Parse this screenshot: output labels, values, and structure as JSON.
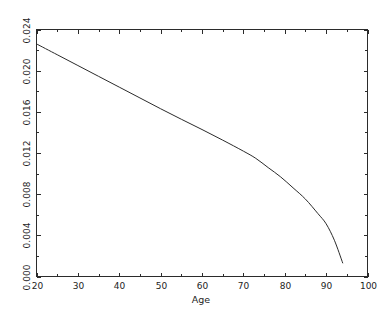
{
  "chart_data": {
    "type": "line",
    "title": "",
    "subtitle": "",
    "xlabel": "Age",
    "ylabel": "",
    "xlim": [
      20,
      100
    ],
    "ylim": [
      0.0,
      0.024
    ],
    "grid": false,
    "legend": null,
    "x_ticks": [
      20,
      30,
      40,
      50,
      60,
      70,
      80,
      90,
      100
    ],
    "x_tick_labels": [
      "20",
      "30",
      "40",
      "50",
      "60",
      "70",
      "80",
      "90",
      "100"
    ],
    "x_minor_tick_step": 5,
    "y_ticks": [
      0.0,
      0.004,
      0.008,
      0.012,
      0.016,
      0.02,
      0.024
    ],
    "y_tick_labels": [
      "0.000",
      "0.004",
      "0.008",
      "0.012",
      "0.016",
      "0.020",
      "0.024"
    ],
    "series": [
      {
        "name": "hazard",
        "color": "#2b2b2b",
        "x": [
          20,
          25,
          30,
          35,
          40,
          45,
          50,
          55,
          60,
          65,
          70,
          73,
          76,
          79,
          82,
          85,
          88,
          90,
          92,
          94
        ],
        "values": [
          0.0226,
          0.02155,
          0.0205,
          0.01945,
          0.0184,
          0.01735,
          0.0163,
          0.01528,
          0.01428,
          0.01325,
          0.01218,
          0.01148,
          0.01058,
          0.00968,
          0.00862,
          0.00752,
          0.00612,
          0.00512,
          0.00352,
          0.00132
        ]
      }
    ]
  },
  "axis": {
    "x_title": "Age"
  }
}
